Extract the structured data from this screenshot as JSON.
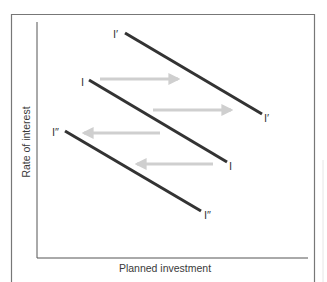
{
  "diagram": {
    "title": "",
    "x_axis_label": "Planned investment",
    "y_axis_label": "Rate of interest",
    "curves": [
      {
        "name": "I'",
        "label_start": "I′",
        "label_end": "I′",
        "x1": 125,
        "y1": 33,
        "x2": 262,
        "y2": 114
      },
      {
        "name": "I",
        "label_start": "I",
        "label_end": "I",
        "x1": 89,
        "y1": 80,
        "x2": 227,
        "y2": 162
      },
      {
        "name": "I''",
        "label_start": "I″",
        "label_end": "I″",
        "x1": 65,
        "y1": 131,
        "x2": 201,
        "y2": 211
      }
    ],
    "arrows": [
      {
        "direction": "right",
        "from_x": 100,
        "to_x": 180,
        "y": 79
      },
      {
        "direction": "right",
        "from_x": 153,
        "to_x": 233,
        "y": 110
      },
      {
        "direction": "left",
        "from_x": 160,
        "to_x": 82,
        "y": 133
      },
      {
        "direction": "left",
        "from_x": 213,
        "to_x": 135,
        "y": 164
      }
    ],
    "colors": {
      "curve": "#333333",
      "arrow": "#cfcfcf",
      "axis": "#555555",
      "frame": "#777777",
      "text": "#3a3a3a"
    }
  }
}
